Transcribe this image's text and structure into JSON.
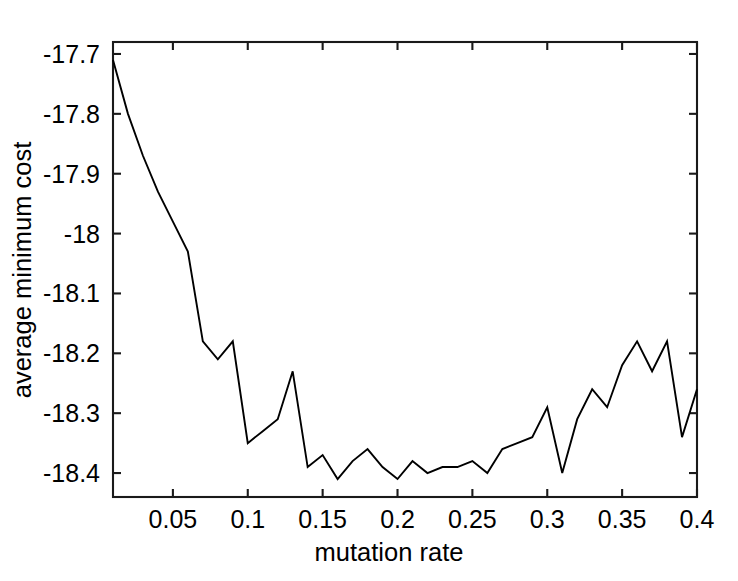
{
  "chart_data": {
    "type": "line",
    "title": "",
    "subtitle": "",
    "xlabel": "mutation rate",
    "ylabel": "average minimum cost",
    "xlim": [
      0.01,
      0.4
    ],
    "ylim": [
      -18.44,
      -17.68
    ],
    "grid": false,
    "legend": null,
    "xticks": [
      0.05,
      0.1,
      0.15,
      0.2,
      0.25,
      0.3,
      0.35,
      0.4
    ],
    "xtick_labels": [
      "0.05",
      "0.1",
      "0.15",
      "0.2",
      "0.25",
      "0.3",
      "0.35",
      "0.4"
    ],
    "yticks": [
      -17.7,
      -17.8,
      -17.9,
      -18.0,
      -18.1,
      -18.2,
      -18.3,
      -18.4
    ],
    "ytick_labels": [
      "-17.7",
      "-17.8",
      "-17.9",
      "-18",
      "-18.1",
      "-18.2",
      "-18.3",
      "-18.4"
    ],
    "series": [
      {
        "name": "average minimum cost",
        "color": "#000000",
        "x": [
          0.01,
          0.02,
          0.03,
          0.04,
          0.05,
          0.06,
          0.07,
          0.08,
          0.09,
          0.1,
          0.11,
          0.12,
          0.13,
          0.14,
          0.15,
          0.16,
          0.17,
          0.18,
          0.19,
          0.2,
          0.21,
          0.22,
          0.23,
          0.24,
          0.25,
          0.26,
          0.27,
          0.28,
          0.29,
          0.3,
          0.31,
          0.32,
          0.33,
          0.34,
          0.35,
          0.36,
          0.37,
          0.38,
          0.39,
          0.4
        ],
        "y": [
          -17.71,
          -17.8,
          -17.87,
          -17.93,
          -17.98,
          -18.03,
          -18.18,
          -18.21,
          -18.18,
          -18.35,
          -18.33,
          -18.31,
          -18.23,
          -18.39,
          -18.37,
          -18.41,
          -18.38,
          -18.36,
          -18.39,
          -18.41,
          -18.38,
          -18.4,
          -18.39,
          -18.39,
          -18.38,
          -18.4,
          -18.36,
          -18.35,
          -18.34,
          -18.29,
          -18.4,
          -18.31,
          -18.26,
          -18.29,
          -18.22,
          -18.18,
          -18.23,
          -18.18,
          -18.34,
          -18.26
        ]
      }
    ]
  },
  "axis": {
    "x_title": "mutation rate",
    "y_title": "average minimum cost"
  }
}
